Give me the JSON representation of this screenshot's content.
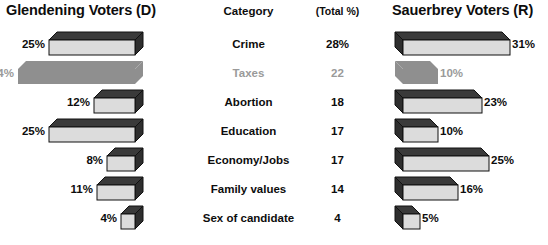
{
  "header": {
    "left_title": "Glendening Voters  (D)",
    "category_title": "Category",
    "total_title": "(Total %)",
    "right_title": "Sauerbrey Voters  (R)"
  },
  "colors": {
    "bar_front": "#dcdcdc",
    "bar_top": "#3a3a3a",
    "bar_side": "#2e2e2e",
    "bar_outline": "#111111",
    "muted_fill": "#8f8f8f",
    "muted_text": "#9a9a9a",
    "text": "#0d0d0d",
    "background": "#ffffff"
  },
  "chart_data": {
    "type": "bar",
    "orientation": "horizontal",
    "layout": "diverging-tornado",
    "grid": false,
    "legend_position": "none",
    "xlabel": "",
    "ylabel": "",
    "categories": [
      "Crime",
      "Taxes",
      "Abortion",
      "Education",
      "Economy/Jobs",
      "Family values",
      "Sex of candidate"
    ],
    "total_percent": [
      "28%",
      "22",
      "18",
      "17",
      "17",
      "14",
      "4"
    ],
    "series": [
      {
        "name": "Glendening Voters  (D)",
        "side": "left",
        "labels": [
          "25%",
          "34%",
          "12%",
          "25%",
          "8%",
          "11%",
          "4%"
        ],
        "values": [
          25,
          34,
          12,
          25,
          8,
          11,
          4
        ]
      },
      {
        "name": "Sauerbrey Voters  (R)",
        "side": "right",
        "labels": [
          "31%",
          "10%",
          "23%",
          "10%",
          "25%",
          "16%",
          "5%"
        ],
        "values": [
          31,
          10,
          23,
          10,
          25,
          16,
          5
        ]
      }
    ],
    "muted_rows": [
      "Taxes"
    ]
  },
  "rows": [
    {
      "category": "Crime",
      "total": "28%",
      "left_label": "25%",
      "left_value": 25,
      "right_label": "31%",
      "right_value": 31,
      "muted": false
    },
    {
      "category": "Taxes",
      "total": "22",
      "left_label": "34%",
      "left_value": 34,
      "right_label": "10%",
      "right_value": 10,
      "muted": true
    },
    {
      "category": "Abortion",
      "total": "18",
      "left_label": "12%",
      "left_value": 12,
      "right_label": "23%",
      "right_value": 23,
      "muted": false
    },
    {
      "category": "Education",
      "total": "17",
      "left_label": "25%",
      "left_value": 25,
      "right_label": "10%",
      "right_value": 10,
      "muted": false
    },
    {
      "category": "Economy/Jobs",
      "total": "17",
      "left_label": "8%",
      "left_value": 8,
      "right_label": "25%",
      "right_value": 25,
      "muted": false
    },
    {
      "category": "Family values",
      "total": "14",
      "left_label": "11%",
      "left_value": 11,
      "right_label": "16%",
      "right_value": 16,
      "muted": false
    },
    {
      "category": "Sex of candidate",
      "total": "4",
      "left_label": "4%",
      "left_value": 4,
      "right_label": "5%",
      "right_value": 5,
      "muted": false
    }
  ]
}
